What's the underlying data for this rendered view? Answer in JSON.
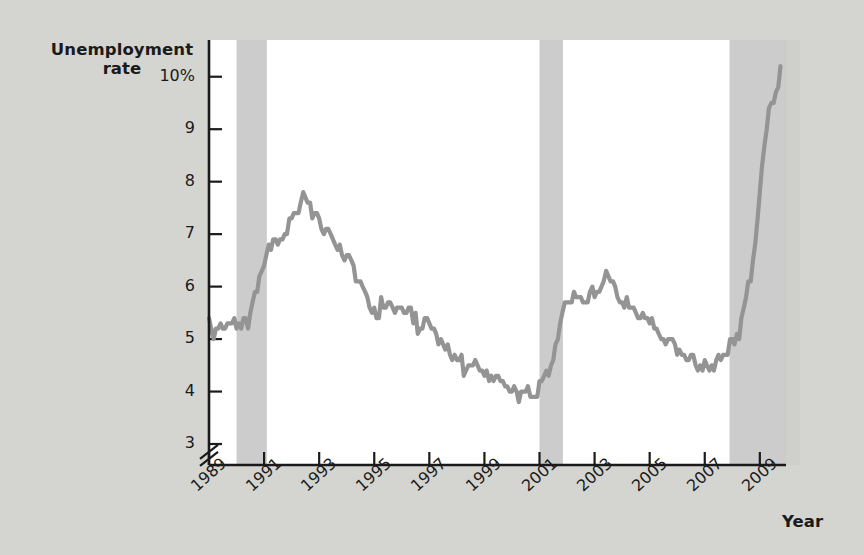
{
  "chart_data": {
    "type": "line",
    "title": "",
    "ylabel": "Unemployment rate",
    "xlabel": "Year",
    "ylim": [
      2.6,
      10.7
    ],
    "xlim": [
      1989.0,
      2009.95
    ],
    "grid": false,
    "legend": "none",
    "axis_break_y": true,
    "y_ticks": [
      {
        "value": 10,
        "label": "10%"
      },
      {
        "value": 9,
        "label": "9"
      },
      {
        "value": 8,
        "label": "8"
      },
      {
        "value": 7,
        "label": "7"
      },
      {
        "value": 6,
        "label": "6"
      },
      {
        "value": 5,
        "label": "5"
      },
      {
        "value": 4,
        "label": "4"
      },
      {
        "value": 3,
        "label": "3"
      }
    ],
    "x_ticks": [
      {
        "value": 1989,
        "label": "1989"
      },
      {
        "value": 1991,
        "label": "1991"
      },
      {
        "value": 1993,
        "label": "1993"
      },
      {
        "value": 1995,
        "label": "1995"
      },
      {
        "value": 1997,
        "label": "1997"
      },
      {
        "value": 1999,
        "label": "1999"
      },
      {
        "value": 2001,
        "label": "2001"
      },
      {
        "value": 2003,
        "label": "2003"
      },
      {
        "value": 2005,
        "label": "2005"
      },
      {
        "value": 2007,
        "label": "2007"
      },
      {
        "value": 2009,
        "label": "2009"
      }
    ],
    "recession_bands": [
      {
        "start": 1990.0,
        "end": 1991.1,
        "label": "1990-91 recession"
      },
      {
        "start": 2001.0,
        "end": 2001.85,
        "label": "2001 recession"
      },
      {
        "start": 2007.9,
        "end": 2009.95,
        "label": "2007-09 recession"
      }
    ],
    "series": [
      {
        "name": "Unemployment rate",
        "color": "#949494",
        "x": [
          1989.0,
          1989.08,
          1989.17,
          1989.25,
          1989.33,
          1989.42,
          1989.5,
          1989.58,
          1989.67,
          1989.75,
          1989.83,
          1989.92,
          1990.0,
          1990.08,
          1990.17,
          1990.25,
          1990.33,
          1990.42,
          1990.5,
          1990.58,
          1990.67,
          1990.75,
          1990.83,
          1990.92,
          1991.0,
          1991.08,
          1991.17,
          1991.25,
          1991.33,
          1991.42,
          1991.5,
          1991.58,
          1991.67,
          1991.75,
          1991.83,
          1991.92,
          1992.0,
          1992.08,
          1992.17,
          1992.25,
          1992.33,
          1992.42,
          1992.5,
          1992.58,
          1992.67,
          1992.75,
          1992.83,
          1992.92,
          1993.0,
          1993.08,
          1993.17,
          1993.25,
          1993.33,
          1993.42,
          1993.5,
          1993.58,
          1993.67,
          1993.75,
          1993.83,
          1993.92,
          1994.0,
          1994.08,
          1994.17,
          1994.25,
          1994.33,
          1994.42,
          1994.5,
          1994.58,
          1994.67,
          1994.75,
          1994.83,
          1994.92,
          1995.0,
          1995.08,
          1995.17,
          1995.25,
          1995.33,
          1995.42,
          1995.5,
          1995.58,
          1995.67,
          1995.75,
          1995.83,
          1995.92,
          1996.0,
          1996.08,
          1996.17,
          1996.25,
          1996.33,
          1996.42,
          1996.5,
          1996.58,
          1996.67,
          1996.75,
          1996.83,
          1996.92,
          1997.0,
          1997.08,
          1997.17,
          1997.25,
          1997.33,
          1997.42,
          1997.5,
          1997.58,
          1997.67,
          1997.75,
          1997.83,
          1997.92,
          1998.0,
          1998.08,
          1998.17,
          1998.25,
          1998.33,
          1998.42,
          1998.5,
          1998.58,
          1998.67,
          1998.75,
          1998.83,
          1998.92,
          1999.0,
          1999.08,
          1999.17,
          1999.25,
          1999.33,
          1999.42,
          1999.5,
          1999.58,
          1999.67,
          1999.75,
          1999.83,
          1999.92,
          2000.0,
          2000.08,
          2000.17,
          2000.25,
          2000.33,
          2000.42,
          2000.5,
          2000.58,
          2000.67,
          2000.75,
          2000.83,
          2000.92,
          2001.0,
          2001.08,
          2001.17,
          2001.25,
          2001.33,
          2001.42,
          2001.5,
          2001.58,
          2001.67,
          2001.75,
          2001.83,
          2001.92,
          2002.0,
          2002.08,
          2002.17,
          2002.25,
          2002.33,
          2002.42,
          2002.5,
          2002.58,
          2002.67,
          2002.75,
          2002.83,
          2002.92,
          2003.0,
          2003.08,
          2003.17,
          2003.25,
          2003.33,
          2003.42,
          2003.5,
          2003.58,
          2003.67,
          2003.75,
          2003.83,
          2003.92,
          2004.0,
          2004.08,
          2004.17,
          2004.25,
          2004.33,
          2004.42,
          2004.5,
          2004.58,
          2004.67,
          2004.75,
          2004.83,
          2004.92,
          2005.0,
          2005.08,
          2005.17,
          2005.25,
          2005.33,
          2005.42,
          2005.5,
          2005.58,
          2005.67,
          2005.75,
          2005.83,
          2005.92,
          2006.0,
          2006.08,
          2006.17,
          2006.25,
          2006.33,
          2006.42,
          2006.5,
          2006.58,
          2006.67,
          2006.75,
          2006.83,
          2006.92,
          2007.0,
          2007.08,
          2007.17,
          2007.25,
          2007.33,
          2007.42,
          2007.5,
          2007.58,
          2007.67,
          2007.75,
          2007.83,
          2007.92,
          2008.0,
          2008.08,
          2008.17,
          2008.25,
          2008.33,
          2008.42,
          2008.5,
          2008.58,
          2008.67,
          2008.75,
          2008.83,
          2008.92,
          2009.0,
          2009.08,
          2009.17,
          2009.25,
          2009.33,
          2009.42,
          2009.5,
          2009.58,
          2009.67,
          2009.75
        ],
        "y": [
          5.4,
          5.2,
          5.0,
          5.2,
          5.2,
          5.3,
          5.2,
          5.2,
          5.3,
          5.3,
          5.3,
          5.4,
          5.2,
          5.3,
          5.2,
          5.4,
          5.4,
          5.2,
          5.5,
          5.7,
          5.9,
          5.9,
          6.2,
          6.3,
          6.4,
          6.6,
          6.8,
          6.7,
          6.9,
          6.9,
          6.8,
          6.9,
          6.9,
          7.0,
          7.0,
          7.3,
          7.3,
          7.4,
          7.4,
          7.4,
          7.6,
          7.8,
          7.7,
          7.6,
          7.6,
          7.3,
          7.4,
          7.4,
          7.3,
          7.1,
          7.0,
          7.1,
          7.1,
          7.0,
          6.9,
          6.8,
          6.7,
          6.8,
          6.6,
          6.5,
          6.6,
          6.6,
          6.5,
          6.4,
          6.1,
          6.1,
          6.1,
          6.0,
          5.9,
          5.8,
          5.6,
          5.5,
          5.6,
          5.4,
          5.4,
          5.8,
          5.6,
          5.6,
          5.7,
          5.7,
          5.6,
          5.5,
          5.6,
          5.6,
          5.6,
          5.5,
          5.5,
          5.6,
          5.6,
          5.3,
          5.5,
          5.1,
          5.2,
          5.2,
          5.4,
          5.4,
          5.3,
          5.2,
          5.2,
          5.1,
          4.9,
          5.0,
          4.9,
          4.8,
          4.9,
          4.7,
          4.6,
          4.7,
          4.6,
          4.6,
          4.7,
          4.3,
          4.4,
          4.5,
          4.5,
          4.5,
          4.6,
          4.5,
          4.4,
          4.4,
          4.3,
          4.4,
          4.2,
          4.3,
          4.2,
          4.3,
          4.3,
          4.2,
          4.2,
          4.1,
          4.1,
          4.0,
          4.0,
          4.1,
          4.0,
          3.8,
          4.0,
          4.0,
          4.0,
          4.1,
          3.9,
          3.9,
          3.9,
          3.9,
          4.2,
          4.2,
          4.3,
          4.4,
          4.3,
          4.5,
          4.6,
          4.9,
          5.0,
          5.3,
          5.5,
          5.7,
          5.7,
          5.7,
          5.7,
          5.9,
          5.8,
          5.8,
          5.8,
          5.7,
          5.7,
          5.7,
          5.9,
          6.0,
          5.8,
          5.9,
          5.9,
          6.0,
          6.1,
          6.3,
          6.2,
          6.1,
          6.1,
          6.0,
          5.8,
          5.7,
          5.7,
          5.6,
          5.8,
          5.6,
          5.6,
          5.6,
          5.5,
          5.4,
          5.4,
          5.5,
          5.4,
          5.4,
          5.3,
          5.4,
          5.2,
          5.2,
          5.1,
          5.0,
          5.0,
          4.9,
          5.0,
          5.0,
          5.0,
          4.9,
          4.7,
          4.8,
          4.7,
          4.7,
          4.6,
          4.6,
          4.7,
          4.7,
          4.5,
          4.4,
          4.5,
          4.4,
          4.6,
          4.5,
          4.4,
          4.5,
          4.4,
          4.6,
          4.7,
          4.6,
          4.7,
          4.7,
          4.7,
          5.0,
          5.0,
          4.9,
          5.1,
          5.0,
          5.4,
          5.6,
          5.8,
          6.1,
          6.1,
          6.5,
          6.8,
          7.3,
          7.8,
          8.3,
          8.7,
          9.0,
          9.4,
          9.5,
          9.5,
          9.7,
          9.8,
          10.2
        ]
      }
    ]
  },
  "plot_geometry": {
    "left": 209,
    "right": 786,
    "top": 40,
    "bottom": 465,
    "axis_break_y_value": 2.85
  },
  "colors": {
    "background": "#d4d4d0",
    "plot_background": "#ffffff",
    "line": "#949494",
    "recession_band": "#cccccc",
    "axis": "#1a1a1a",
    "text": "#1a1a1a"
  }
}
